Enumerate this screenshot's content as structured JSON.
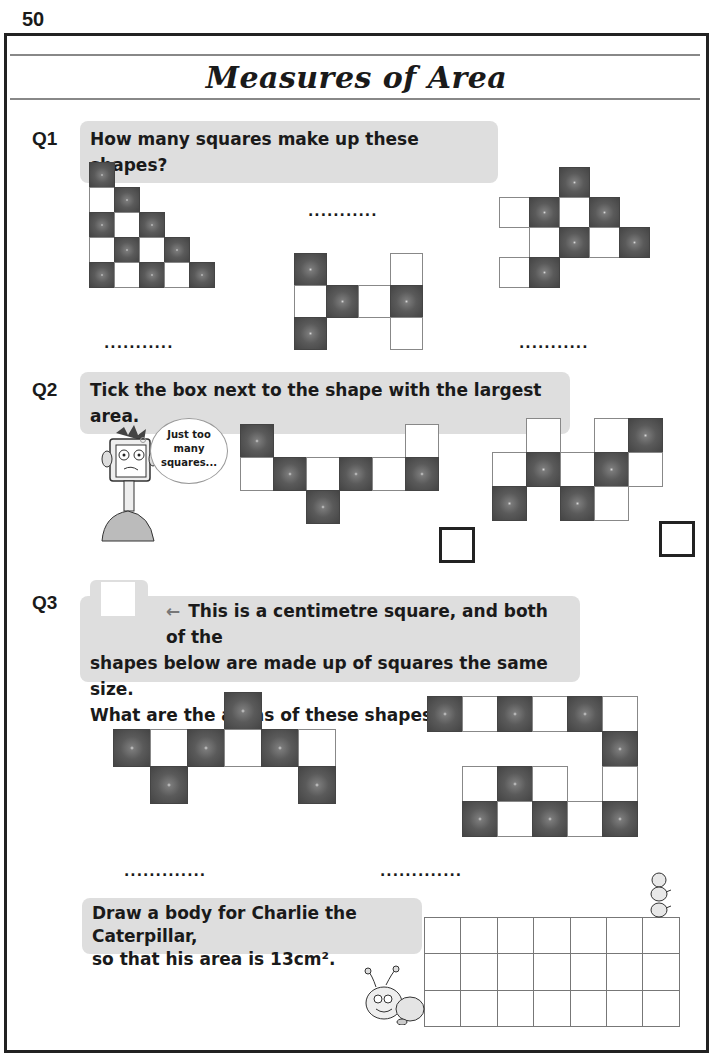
{
  "page_number": "50",
  "title": "Measures of Area",
  "q1": {
    "label": "Q1",
    "prompt": "How many squares make up these shapes?",
    "answer_placeholder": "...........",
    "shapes": [
      {
        "x": 89,
        "y": 162,
        "size": 25,
        "cells": [
          [
            0,
            0,
            "d"
          ],
          [
            1,
            0,
            "w"
          ],
          [
            1,
            1,
            "d"
          ],
          [
            2,
            0,
            "d"
          ],
          [
            2,
            1,
            "w"
          ],
          [
            2,
            2,
            "d"
          ],
          [
            3,
            0,
            "w"
          ],
          [
            3,
            1,
            "d"
          ],
          [
            3,
            2,
            "w"
          ],
          [
            3,
            3,
            "d"
          ],
          [
            4,
            0,
            "d"
          ],
          [
            4,
            1,
            "w"
          ],
          [
            4,
            2,
            "d"
          ],
          [
            4,
            3,
            "w"
          ],
          [
            4,
            4,
            "d"
          ]
        ]
      },
      {
        "x": 294,
        "y": 253,
        "size": 32,
        "cells": [
          [
            0,
            0,
            "d"
          ],
          [
            0,
            3,
            "w"
          ],
          [
            1,
            0,
            "w"
          ],
          [
            1,
            1,
            "d"
          ],
          [
            1,
            2,
            "w"
          ],
          [
            1,
            3,
            "d"
          ],
          [
            2,
            0,
            "d"
          ],
          [
            2,
            3,
            "w"
          ]
        ]
      },
      {
        "x": 499,
        "y": 167,
        "size": 30,
        "cells": [
          [
            0,
            2,
            "d"
          ],
          [
            1,
            0,
            "w"
          ],
          [
            1,
            1,
            "d"
          ],
          [
            1,
            2,
            "w"
          ],
          [
            1,
            3,
            "d"
          ],
          [
            2,
            1,
            "w"
          ],
          [
            2,
            2,
            "d"
          ],
          [
            2,
            3,
            "w"
          ],
          [
            2,
            4,
            "d"
          ],
          [
            3,
            0,
            "w"
          ],
          [
            3,
            1,
            "d"
          ]
        ]
      }
    ]
  },
  "q2": {
    "label": "Q2",
    "prompt": "Tick the box next to the shape with the largest area.",
    "speech_bubble": "Just too many squares...",
    "shapes": [
      {
        "x": 240,
        "y": 424,
        "size": 33,
        "cells": [
          [
            0,
            0,
            "d"
          ],
          [
            0,
            5,
            "w"
          ],
          [
            1,
            0,
            "w"
          ],
          [
            1,
            1,
            "d"
          ],
          [
            1,
            2,
            "w"
          ],
          [
            1,
            3,
            "d"
          ],
          [
            1,
            4,
            "w"
          ],
          [
            1,
            5,
            "d"
          ],
          [
            2,
            2,
            "d"
          ]
        ]
      },
      {
        "x": 492,
        "y": 418,
        "size": 34,
        "cells": [
          [
            0,
            1,
            "w"
          ],
          [
            0,
            3,
            "w"
          ],
          [
            0,
            4,
            "d"
          ],
          [
            1,
            0,
            "w"
          ],
          [
            1,
            1,
            "d"
          ],
          [
            1,
            2,
            "w"
          ],
          [
            1,
            3,
            "d"
          ],
          [
            1,
            4,
            "w"
          ],
          [
            2,
            0,
            "d"
          ],
          [
            2,
            2,
            "d"
          ],
          [
            2,
            3,
            "w"
          ]
        ]
      }
    ]
  },
  "q3": {
    "label": "Q3",
    "arrow": "←",
    "prompt_line1": "This is a centimetre square, and both of the",
    "prompt_line2": "shapes below are made up of squares the same size.",
    "prompt_line3": "What are the areas of these shapes in cm²?",
    "answer_placeholder": ".............",
    "shapes": [
      {
        "x": 113,
        "y": 692,
        "size": 37,
        "cells": [
          [
            0,
            3,
            "d"
          ],
          [
            1,
            0,
            "d"
          ],
          [
            1,
            1,
            "w"
          ],
          [
            1,
            2,
            "d"
          ],
          [
            1,
            3,
            "w"
          ],
          [
            1,
            4,
            "d"
          ],
          [
            1,
            5,
            "w"
          ],
          [
            2,
            1,
            "d"
          ],
          [
            2,
            5,
            "d"
          ]
        ]
      },
      {
        "x": 427,
        "y": 696,
        "size": 35,
        "cells": [
          [
            0,
            0,
            "d"
          ],
          [
            0,
            1,
            "w"
          ],
          [
            0,
            2,
            "d"
          ],
          [
            0,
            3,
            "w"
          ],
          [
            0,
            4,
            "d"
          ],
          [
            0,
            5,
            "w"
          ],
          [
            1,
            5,
            "d"
          ],
          [
            2,
            1,
            "w"
          ],
          [
            2,
            2,
            "d"
          ],
          [
            2,
            3,
            "w"
          ],
          [
            2,
            5,
            "w"
          ],
          [
            3,
            1,
            "d"
          ],
          [
            3,
            2,
            "w"
          ],
          [
            3,
            3,
            "d"
          ],
          [
            3,
            4,
            "w"
          ],
          [
            3,
            5,
            "d"
          ]
        ]
      }
    ]
  },
  "caterpillar": {
    "prompt_line1": "Draw a body for Charlie the Caterpillar,",
    "prompt_line2": "so that his area is 13cm².",
    "grid": {
      "x": 424,
      "y": 917,
      "cols": 7,
      "rows": 3,
      "size": 36.4
    }
  }
}
